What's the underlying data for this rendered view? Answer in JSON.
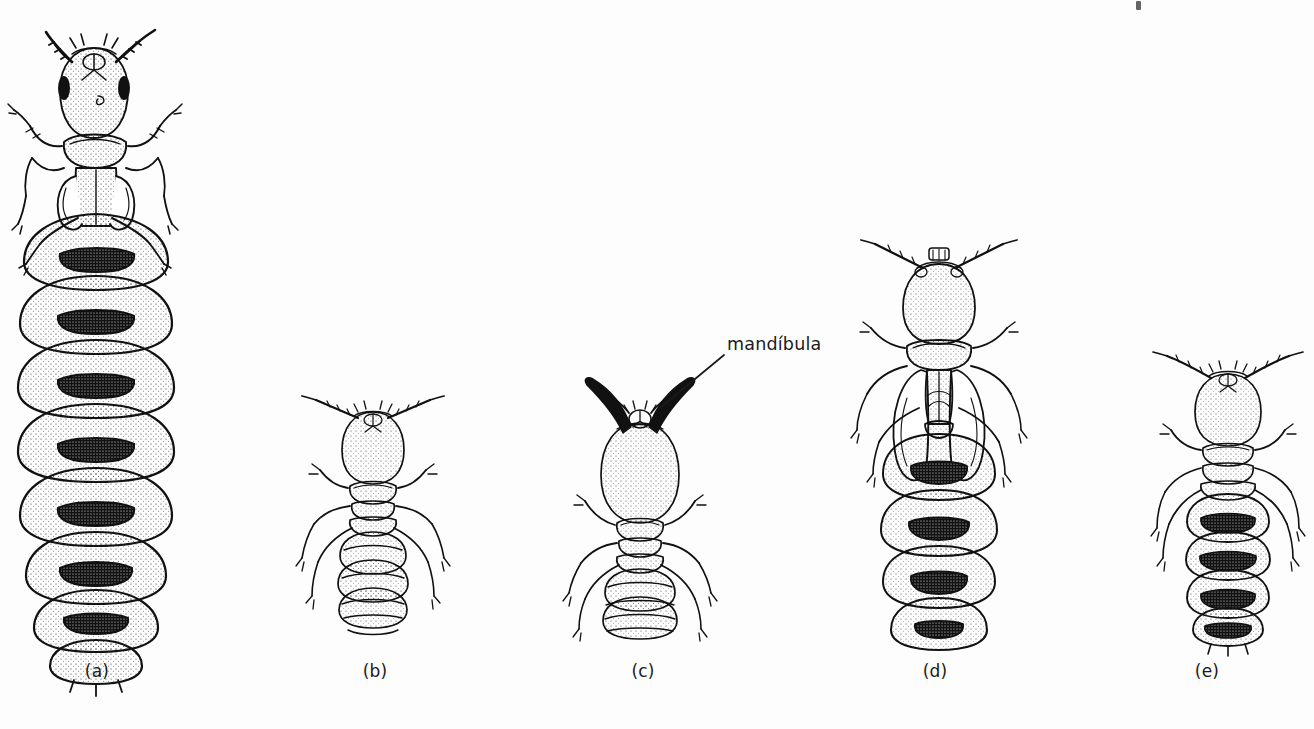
{
  "plate": {
    "kind": "scientific-illustration",
    "subject": "termite castes",
    "background_color": "#fdfdfd",
    "ink_color": "#111111",
    "width": 1314,
    "height": 729
  },
  "callouts": [
    {
      "id": "mandibula",
      "text": "mandíbula",
      "points_to": "figure-c-mandible"
    }
  ],
  "figures": [
    {
      "id": "a",
      "caption": "(a)",
      "caste": "queen-physogastric",
      "segments": 9
    },
    {
      "id": "b",
      "caption": "(b)",
      "caste": "worker",
      "segments": 9
    },
    {
      "id": "c",
      "caption": "(c)",
      "caste": "soldier",
      "segments": 9
    },
    {
      "id": "d",
      "caption": "(d)",
      "caste": "alate-reproductive",
      "segments": 7
    },
    {
      "id": "e",
      "caption": "(e)",
      "caste": "neotenic-reproductive",
      "segments": 8
    }
  ],
  "artifacts": [
    {
      "id": "scan-mark",
      "description": "scan smudge top-right"
    }
  ]
}
